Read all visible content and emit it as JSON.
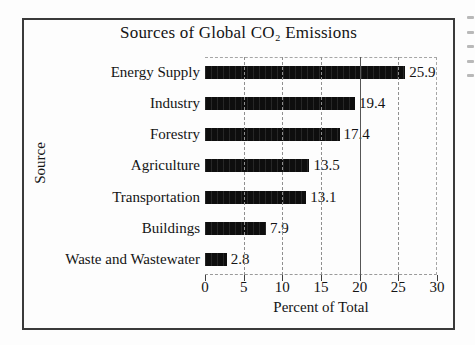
{
  "chart_data": {
    "type": "bar",
    "orientation": "horizontal",
    "title": "Sources of Global CO₂ Emissions",
    "categories": [
      "Energy Supply",
      "Industry",
      "Forestry",
      "Agriculture",
      "Transportation",
      "Buildings",
      "Waste and Wastewater"
    ],
    "values": [
      25.9,
      19.4,
      17.4,
      13.5,
      13.1,
      7.9,
      2.8
    ],
    "value_labels": [
      "25.9",
      "19.4",
      "17.4",
      "13.5",
      "13.1",
      "7.9",
      "2.8"
    ],
    "xlabel": "Percent of Total",
    "ylabel": "Source",
    "xlim": [
      0,
      30
    ],
    "xticks": [
      0,
      5,
      10,
      15,
      20,
      25,
      30
    ],
    "grid": "vertical dashed gridlines at each tick; line at 20 darker solid",
    "legend": "none",
    "bar_color": "#0e0e0e",
    "gridline_color": "#8f8f8f",
    "emphasis_gridline_value": 20,
    "emphasis_gridline_color": "#565656",
    "frame_border_color": "#3a3a3a",
    "background_color": "#fdfdfd"
  }
}
